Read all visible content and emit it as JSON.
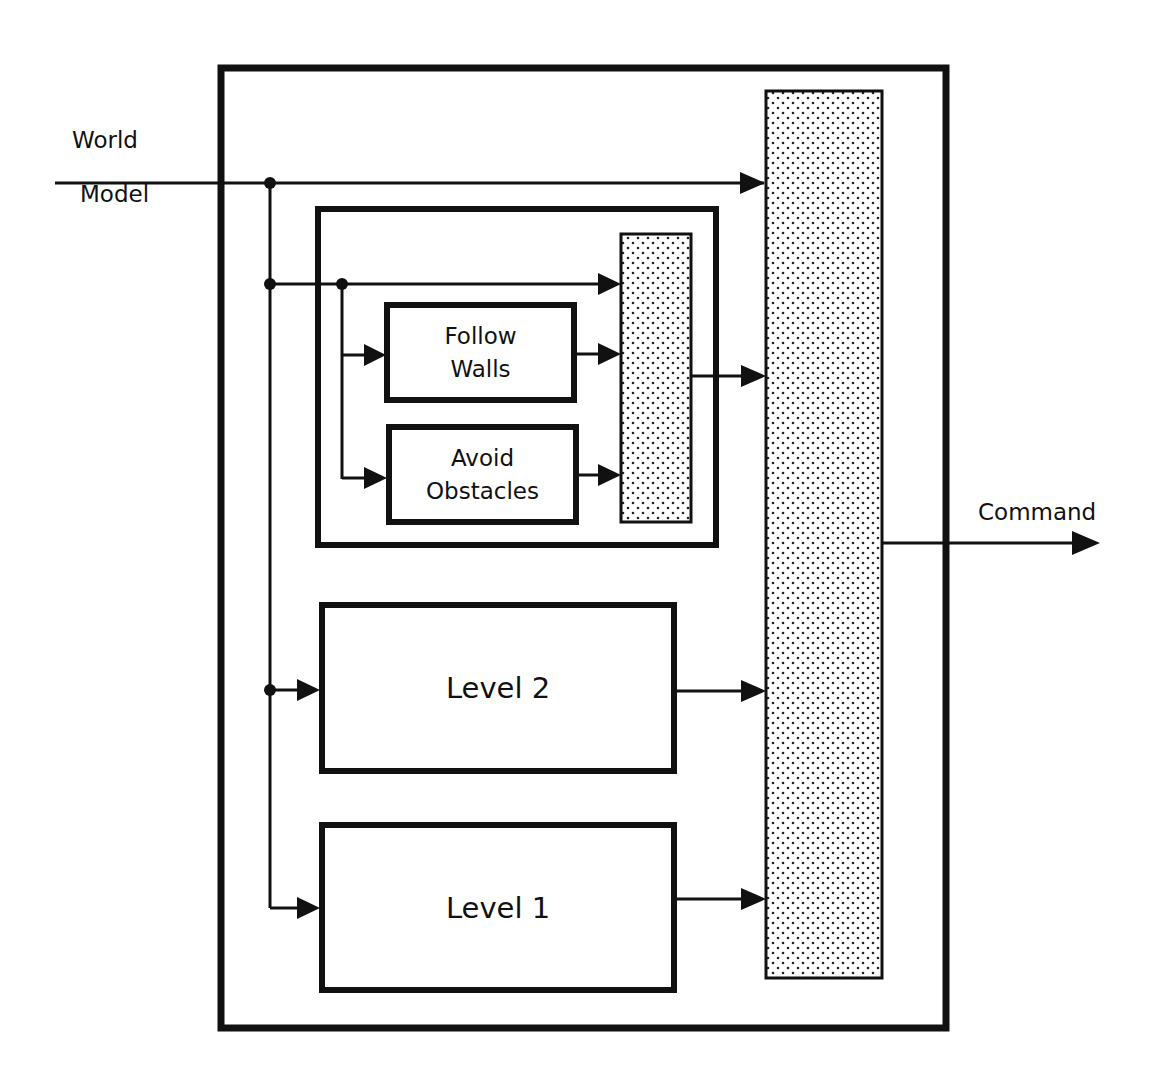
{
  "diagram": {
    "type": "subsumption-control-architecture",
    "colors": {
      "stroke": "#111111",
      "background": "#ffffff",
      "stipple_dot": "#222222"
    },
    "input": {
      "label_top": "World",
      "label_bottom": "Model"
    },
    "output": {
      "label": "Command"
    },
    "behaviors": {
      "follow_walls": {
        "line1": "Follow",
        "line2": "Walls"
      },
      "avoid_obstacles": {
        "line1": "Avoid",
        "line2": "Obstacles"
      }
    },
    "levels": {
      "level2": {
        "label": "Level 2"
      },
      "level1": {
        "label": "Level 1"
      }
    },
    "arbiters": [
      {
        "name": "level3-arbiter",
        "pattern": "stipple"
      },
      {
        "name": "main-arbiter",
        "pattern": "stipple"
      }
    ]
  }
}
